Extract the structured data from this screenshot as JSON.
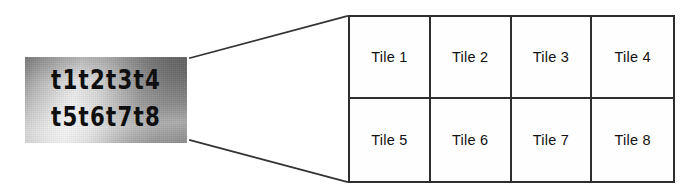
{
  "figure": {
    "name": "tile-segmentation-diagram",
    "sample": {
      "name": "scanned-text-sample",
      "line_1": "t1t2t3t4",
      "line_2": "t5t6t7t8",
      "background_description": "uneven-grayscale-gradient",
      "text_color": "#080808",
      "gradient_light": "#f2f2f2",
      "gradient_dark": "#636363"
    },
    "connectors": {
      "name": "expansion-connector-lines",
      "color": "#333333",
      "top_line": {
        "x1": 190,
        "y1": 58,
        "x2": 347,
        "y2": 16
      },
      "bottom_line": {
        "x1": 190,
        "y1": 140,
        "x2": 347,
        "y2": 182
      }
    },
    "grid": {
      "name": "tile-grid",
      "columns": 4,
      "rows": 2,
      "border_color": "#2e2e2e",
      "cells": [
        {
          "label": "Tile 1"
        },
        {
          "label": "Tile 2"
        },
        {
          "label": "Tile 3"
        },
        {
          "label": "Tile 4"
        },
        {
          "label": "Tile 5"
        },
        {
          "label": "Tile 6"
        },
        {
          "label": "Tile 7"
        },
        {
          "label": "Tile 8"
        }
      ]
    }
  }
}
